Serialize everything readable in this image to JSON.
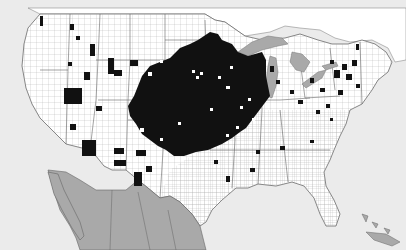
{
  "map": {
    "type": "county-distribution-map",
    "region": "United States (contiguous)",
    "legend": null,
    "colors": {
      "ocean": "#ebebeb",
      "land_us": "#ffffff",
      "land_canada": "#ffffff",
      "mexico": "#a9a9a9",
      "lakes": "#a9a9a9",
      "present_county": "#111111",
      "county_border": "#9a9a9a",
      "state_border": "#555555"
    },
    "features": [
      {
        "name": "canada",
        "fill": "land_canada"
      },
      {
        "name": "united-states",
        "fill": "land_us"
      },
      {
        "name": "mexico",
        "fill": "mexico"
      },
      {
        "name": "great-lakes",
        "fill": "lakes"
      },
      {
        "name": "bahamas",
        "fill": "mexico"
      },
      {
        "name": "cuba",
        "fill": "mexico"
      }
    ],
    "distribution_regions": [
      "Central Great Plains and Midwest core (large contiguous area)",
      "Scattered counties in Mountain West",
      "Scattered counties in Northeast and Mid-Atlantic",
      "Scattered counties in Southeast",
      "Southwest (Arizona, New Mexico) patches"
    ]
  }
}
